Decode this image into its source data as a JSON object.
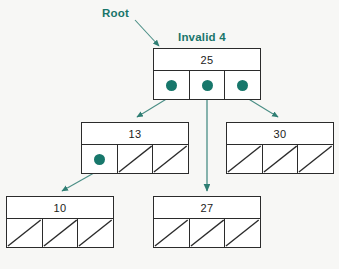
{
  "diagram": {
    "colors": {
      "accent": "#17776b",
      "node_border": "#2b2b2b",
      "node_fill": "#ffffff",
      "background": "#f7f7f5"
    },
    "labels": {
      "root": "Root",
      "invalid": "Invalid 4"
    },
    "nodes": [
      {
        "id": "root",
        "key": "25",
        "x": 153,
        "y": 48,
        "w": 108,
        "pointers": [
          "dot",
          "dot",
          "dot"
        ]
      },
      {
        "id": "n13",
        "key": "13",
        "x": 81,
        "y": 122,
        "w": 108,
        "pointers": [
          "dot",
          "null",
          "null"
        ]
      },
      {
        "id": "n30",
        "key": "30",
        "x": 226,
        "y": 122,
        "w": 108,
        "pointers": [
          "null",
          "null",
          "null"
        ]
      },
      {
        "id": "n10",
        "key": "10",
        "x": 6,
        "y": 196,
        "w": 108,
        "pointers": [
          "null",
          "null",
          "null"
        ]
      },
      {
        "id": "n27",
        "key": "27",
        "x": 153,
        "y": 196,
        "w": 108,
        "pointers": [
          "null",
          "null",
          "null"
        ]
      }
    ],
    "edges": [
      {
        "from": "root-ptr-0",
        "to": "n13",
        "path": "M 172 94 L 134 118"
      },
      {
        "from": "root-ptr-1",
        "to": "n27",
        "path": "M 207 92 L 207 192"
      },
      {
        "from": "root-ptr-2",
        "to": "n30",
        "path": "M 242 94 L 281 118"
      },
      {
        "from": "n13-ptr-0",
        "to": "n10",
        "path": "M 100 168 L 63 192"
      },
      {
        "from": "root-label",
        "to": "root",
        "path": "M 135 20 L 161 47"
      }
    ]
  }
}
